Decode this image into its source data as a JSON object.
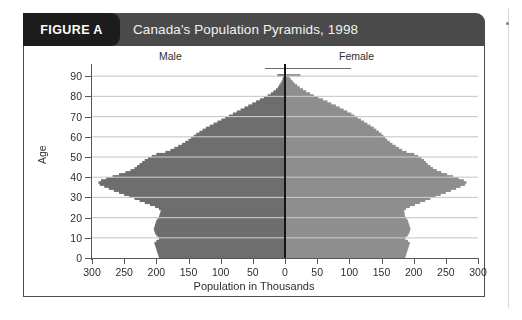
{
  "figure": {
    "badge_label": "FIGURE A",
    "title": "Canada's Population Pyramids, 1998"
  },
  "colors": {
    "header_band": "#4a4a4a",
    "badge": "#1c1c1c",
    "male_bar": "#6e6e6e",
    "female_bar": "#8e8e8e",
    "gridline": "#c9c9c9",
    "axis": "#55565a",
    "center_line": "#151515",
    "panel_border": "#4e4e52"
  },
  "chart_data": {
    "type": "bar",
    "orientation": "horizontal",
    "subtype": "population-pyramid",
    "title": "Canada's Population Pyramids, 1998",
    "xlabel": "Population in Thousands",
    "ylabel": "Age",
    "grid": true,
    "legend_position": "top-inside",
    "side_labels": {
      "left": "Male",
      "right": "Female"
    },
    "xlim": [
      -300,
      300
    ],
    "ylim": [
      0,
      95
    ],
    "x_tick_labels": [
      "300",
      "250",
      "200",
      "150",
      "100",
      "50",
      "0",
      "50",
      "100",
      "150",
      "200",
      "250",
      "300"
    ],
    "x_tick_values": [
      -300,
      -250,
      -200,
      -150,
      -100,
      -50,
      0,
      50,
      100,
      150,
      200,
      250,
      300
    ],
    "y_tick_labels": [
      "0",
      "10",
      "20",
      "30",
      "40",
      "50",
      "60",
      "70",
      "80",
      "90"
    ],
    "y_tick_values": [
      0,
      10,
      20,
      30,
      40,
      50,
      60,
      70,
      80,
      90
    ],
    "ages": [
      0,
      1,
      2,
      3,
      4,
      5,
      6,
      7,
      8,
      9,
      10,
      11,
      12,
      13,
      14,
      15,
      16,
      17,
      18,
      19,
      20,
      21,
      22,
      23,
      24,
      25,
      26,
      27,
      28,
      29,
      30,
      31,
      32,
      33,
      34,
      35,
      36,
      37,
      38,
      39,
      40,
      41,
      42,
      43,
      44,
      45,
      46,
      47,
      48,
      49,
      50,
      51,
      52,
      53,
      54,
      55,
      56,
      57,
      58,
      59,
      60,
      61,
      62,
      63,
      64,
      65,
      66,
      67,
      68,
      69,
      70,
      71,
      72,
      73,
      74,
      75,
      76,
      77,
      78,
      79,
      80,
      81,
      82,
      83,
      84,
      85,
      86,
      87,
      88,
      89,
      90
    ],
    "series": [
      {
        "name": "Male",
        "color": "#6e6e6e",
        "values": [
          196,
          197,
          198,
          199,
          200,
          201,
          202,
          203,
          200,
          196,
          197,
          200,
          202,
          203,
          204,
          203,
          202,
          201,
          200,
          198,
          196,
          195,
          194,
          193,
          196,
          202,
          210,
          218,
          226,
          234,
          242,
          250,
          258,
          266,
          274,
          281,
          288,
          290,
          286,
          278,
          268,
          258,
          248,
          240,
          234,
          230,
          226,
          222,
          218,
          213,
          207,
          200,
          186,
          178,
          172,
          166,
          160,
          155,
          150,
          146,
          142,
          138,
          133,
          128,
          123,
          117,
          111,
          105,
          99,
          93,
          87,
          81,
          75,
          69,
          63,
          57,
          51,
          45,
          39,
          33,
          27,
          22,
          18,
          14,
          11,
          9,
          7,
          5,
          4,
          3,
          12
        ]
      },
      {
        "name": "Female",
        "color": "#8e8e8e",
        "values": [
          187,
          188,
          189,
          190,
          191,
          192,
          193,
          194,
          191,
          187,
          188,
          191,
          193,
          194,
          195,
          194,
          193,
          192,
          191,
          189,
          187,
          186,
          186,
          185,
          188,
          194,
          202,
          210,
          218,
          226,
          234,
          242,
          250,
          258,
          266,
          273,
          280,
          282,
          278,
          270,
          261,
          252,
          243,
          236,
          230,
          226,
          222,
          219,
          216,
          212,
          207,
          201,
          189,
          182,
          177,
          172,
          167,
          163,
          159,
          156,
          153,
          150,
          146,
          142,
          138,
          133,
          128,
          123,
          118,
          113,
          108,
          103,
          97,
          91,
          85,
          79,
          72,
          66,
          59,
          52,
          45,
          39,
          33,
          28,
          23,
          19,
          15,
          12,
          9,
          7,
          24
        ]
      }
    ]
  }
}
